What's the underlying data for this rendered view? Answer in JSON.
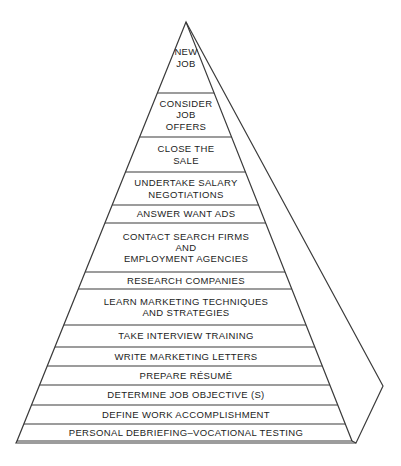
{
  "diagram": {
    "type": "pyramid",
    "orientation": "apex-up",
    "tier_count": 14,
    "colors": {
      "background": "#ffffff",
      "stroke": "#3b3b3b",
      "text": "#1c1c1c"
    },
    "geometry": {
      "apex_x": 186,
      "apex_y": 22,
      "base_left_x": 17,
      "base_right_x": 352,
      "base_y": 441,
      "outer_base_right_x": 356,
      "outer_base_y": 443,
      "side_vertex_x": 383,
      "side_vertex_y": 386
    },
    "tiers": [
      {
        "index": 1,
        "level": "top",
        "label": "NEW\nJOB",
        "y_top": 22,
        "y_bottom": 93,
        "font_size": 9.5
      },
      {
        "index": 2,
        "label": "CONSIDER\nJOB\nOFFERS",
        "y_top": 93,
        "y_bottom": 137,
        "font_size": 9.5
      },
      {
        "index": 3,
        "label": "CLOSE THE\nSALE",
        "y_top": 137,
        "y_bottom": 172,
        "font_size": 9.5
      },
      {
        "index": 4,
        "label": "UNDERTAKE SALARY\nNEGOTIATIONS",
        "y_top": 172,
        "y_bottom": 205,
        "font_size": 9.5
      },
      {
        "index": 5,
        "label": "ANSWER WANT ADS",
        "y_top": 205,
        "y_bottom": 223,
        "font_size": 9.5
      },
      {
        "index": 6,
        "label": "CONTACT SEARCH FIRMS\nAND\nEMPLOYMENT AGENCIES",
        "y_top": 223,
        "y_bottom": 272,
        "font_size": 9.5
      },
      {
        "index": 7,
        "label": "RESEARCH COMPANIES",
        "y_top": 272,
        "y_bottom": 289,
        "font_size": 9.5
      },
      {
        "index": 8,
        "label": "LEARN MARKETING TECHNIQUES\nAND STRATEGIES",
        "y_top": 289,
        "y_bottom": 325,
        "font_size": 9.5
      },
      {
        "index": 9,
        "label": "TAKE INTERVIEW TRAINING",
        "y_top": 325,
        "y_bottom": 347,
        "font_size": 9.5
      },
      {
        "index": 10,
        "label": "WRITE MARKETING LETTERS",
        "y_top": 347,
        "y_bottom": 366,
        "font_size": 9.5
      },
      {
        "index": 11,
        "label": "PREPARE RÉSUMÉ",
        "y_top": 366,
        "y_bottom": 385,
        "font_size": 9.5
      },
      {
        "index": 12,
        "label": "DETERMINE JOB OBJECTIVE (S)",
        "y_top": 385,
        "y_bottom": 405,
        "font_size": 9.5
      },
      {
        "index": 13,
        "label": "DEFINE WORK ACCOMPLISHMENT",
        "y_top": 405,
        "y_bottom": 424,
        "font_size": 9.5
      },
      {
        "index": 14,
        "level": "base",
        "label": "PERSONAL DEBRIEFING–VOCATIONAL TESTING",
        "y_top": 424,
        "y_bottom": 441,
        "font_size": 9.5
      }
    ]
  }
}
